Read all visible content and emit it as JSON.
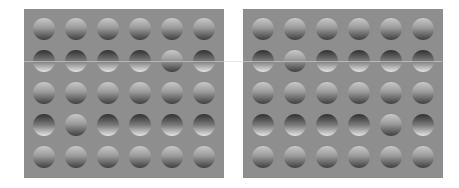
{
  "figure": {
    "panel_background": "#8e8e8e",
    "grid": {
      "rows": 5,
      "cols": 6
    }
  },
  "panels": [
    {
      "id": "left",
      "rows": [
        [
          "convex",
          "convex",
          "convex",
          "convex",
          "convex",
          "convex"
        ],
        [
          "concave",
          "concave",
          "concave",
          "concave",
          "convex",
          "concave"
        ],
        [
          "convex",
          "convex",
          "convex",
          "convex",
          "convex",
          "convex"
        ],
        [
          "concave",
          "convex",
          "concave",
          "concave",
          "concave",
          "concave"
        ],
        [
          "convex",
          "convex",
          "convex",
          "convex",
          "convex",
          "convex"
        ]
      ]
    },
    {
      "id": "right",
      "rows": [
        [
          "convex",
          "convex",
          "convex",
          "convex",
          "convex",
          "convex"
        ],
        [
          "concave",
          "convex",
          "concave",
          "concave",
          "concave",
          "concave"
        ],
        [
          "convex",
          "convex",
          "convex",
          "convex",
          "convex",
          "convex"
        ],
        [
          "concave",
          "concave",
          "concave",
          "concave",
          "convex",
          "concave"
        ],
        [
          "convex",
          "convex",
          "convex",
          "convex",
          "convex",
          "convex"
        ]
      ]
    }
  ]
}
